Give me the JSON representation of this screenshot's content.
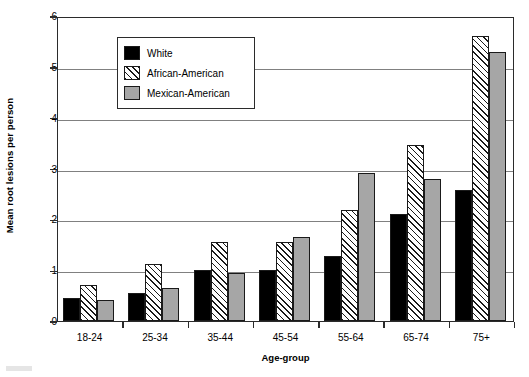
{
  "chart_data": {
    "type": "bar",
    "title": "",
    "xlabel": "Age-group",
    "ylabel": "Mean root lesions per person",
    "categories": [
      "18-24",
      "25-34",
      "35-44",
      "45-54",
      "55-64",
      "65-74",
      "75+"
    ],
    "series": [
      {
        "name": "White",
        "values": [
          0.45,
          0.56,
          1.0,
          1.0,
          1.27,
          2.1,
          2.58
        ],
        "fill": "solid-black",
        "color": "#000000"
      },
      {
        "name": "African-American",
        "values": [
          0.7,
          1.13,
          1.56,
          1.55,
          2.18,
          3.47,
          5.6
        ],
        "fill": "diagonal-hatch",
        "color": "#ffffff"
      },
      {
        "name": "Mexican-American",
        "values": [
          0.41,
          0.64,
          0.95,
          1.65,
          2.92,
          2.8,
          5.3
        ],
        "fill": "solid-gray",
        "color": "#a6a6a6"
      }
    ],
    "ylim": [
      0,
      6
    ],
    "yticks": [
      0,
      1,
      2,
      3,
      4,
      5,
      6
    ],
    "grid": "horizontal",
    "legend_position": "top-left"
  },
  "legend": {
    "items": [
      {
        "label": "White"
      },
      {
        "label": "African-American"
      },
      {
        "label": "Mexican-American"
      }
    ]
  },
  "axes": {
    "y_title": "Mean root lesions per person",
    "x_title": "Age-group",
    "y_tick_labels": [
      "6",
      "5",
      "4",
      "3",
      "2",
      "1",
      "0"
    ],
    "x_tick_labels": [
      "18-24",
      "25-34",
      "35-44",
      "45-54",
      "55-64",
      "65-74",
      "75+"
    ]
  },
  "colors": {
    "frame": "#2b2b2b",
    "grid": "#808080",
    "white_series": "#000000",
    "mexican_series": "#a6a6a6",
    "hatch": "#1a1a1a"
  }
}
